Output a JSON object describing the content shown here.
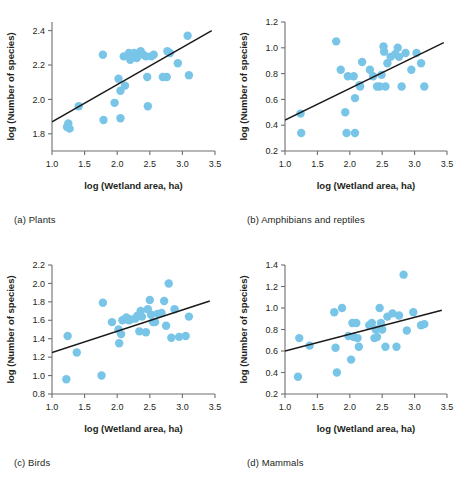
{
  "figure": {
    "marker_color": "#79c5e8",
    "line_color": "#1a1a1a",
    "axis_color": "#6d6e71",
    "text_color": "#231f20"
  },
  "common": {
    "xlabel": "log (Wetland area, ha)",
    "ylabel": "log (Number of species)",
    "xlim": [
      1.0,
      3.5
    ],
    "xticks": [
      1.0,
      1.5,
      2.0,
      2.5,
      3.0,
      3.5
    ],
    "xticklabels": [
      "1.0",
      "1.5",
      "2.0",
      "2.5",
      "3.0",
      "3.5"
    ]
  },
  "chart_data": [
    {
      "id": "panel-a",
      "type": "scatter",
      "caption": "(a) Plants",
      "caption_letter": "(a)",
      "caption_name": "Plants",
      "title": "",
      "xlabel": "log (Wetland area, ha)",
      "ylabel": "log (Number of species)",
      "xlim": [
        1.0,
        3.5
      ],
      "ylim": [
        1.7,
        2.45
      ],
      "xticks": [
        1.0,
        1.5,
        2.0,
        2.5,
        3.0,
        3.5
      ],
      "yticks": [
        1.8,
        2.0,
        2.2,
        2.4
      ],
      "yticklabels": [
        "1.8",
        "2.0",
        "2.2",
        "2.4"
      ],
      "grid": false,
      "legend": "none",
      "trendline": {
        "x0": 1.0,
        "y0": 1.87,
        "x1": 3.45,
        "y1": 2.4
      },
      "points": [
        {
          "x": 1.23,
          "y": 1.84
        },
        {
          "x": 1.27,
          "y": 1.83
        },
        {
          "x": 1.25,
          "y": 1.86
        },
        {
          "x": 1.41,
          "y": 1.96
        },
        {
          "x": 1.78,
          "y": 2.26
        },
        {
          "x": 1.79,
          "y": 1.88
        },
        {
          "x": 1.96,
          "y": 1.98
        },
        {
          "x": 2.02,
          "y": 2.12
        },
        {
          "x": 2.05,
          "y": 2.05
        },
        {
          "x": 2.05,
          "y": 1.89
        },
        {
          "x": 2.1,
          "y": 2.25
        },
        {
          "x": 2.12,
          "y": 2.08
        },
        {
          "x": 2.18,
          "y": 2.27
        },
        {
          "x": 2.2,
          "y": 2.23
        },
        {
          "x": 2.26,
          "y": 2.27
        },
        {
          "x": 2.3,
          "y": 2.24
        },
        {
          "x": 2.36,
          "y": 2.28
        },
        {
          "x": 2.4,
          "y": 2.26
        },
        {
          "x": 2.44,
          "y": 2.25
        },
        {
          "x": 2.46,
          "y": 2.13
        },
        {
          "x": 2.47,
          "y": 1.96
        },
        {
          "x": 2.52,
          "y": 2.25
        },
        {
          "x": 2.56,
          "y": 2.26
        },
        {
          "x": 2.7,
          "y": 2.13
        },
        {
          "x": 2.76,
          "y": 2.13
        },
        {
          "x": 2.77,
          "y": 2.28
        },
        {
          "x": 2.81,
          "y": 2.27
        },
        {
          "x": 2.93,
          "y": 2.21
        },
        {
          "x": 3.08,
          "y": 2.37
        },
        {
          "x": 3.1,
          "y": 2.14
        }
      ]
    },
    {
      "id": "panel-b",
      "type": "scatter",
      "caption": "(b) Amphibians and reptiles",
      "caption_letter": "(b)",
      "caption_name": "Amphibians and reptiles",
      "title": "",
      "xlabel": "log (Wetland area, ha)",
      "ylabel": "log (Number of species)",
      "xlim": [
        1.0,
        3.5
      ],
      "ylim": [
        0.2,
        1.2
      ],
      "xticks": [
        1.0,
        1.5,
        2.0,
        2.5,
        3.0,
        3.5
      ],
      "yticks": [
        0.2,
        0.4,
        0.6,
        0.8,
        1.0,
        1.2
      ],
      "yticklabels": [
        "0.2",
        "0.4",
        "0.6",
        "0.8",
        "1.0",
        "1.2"
      ],
      "grid": false,
      "legend": "none",
      "trendline": {
        "x0": 1.0,
        "y0": 0.44,
        "x1": 3.45,
        "y1": 1.04
      },
      "points": [
        {
          "x": 1.24,
          "y": 0.49
        },
        {
          "x": 1.25,
          "y": 0.34
        },
        {
          "x": 1.79,
          "y": 1.05
        },
        {
          "x": 1.86,
          "y": 0.83
        },
        {
          "x": 1.93,
          "y": 0.5
        },
        {
          "x": 1.95,
          "y": 0.34
        },
        {
          "x": 1.97,
          "y": 0.78
        },
        {
          "x": 2.06,
          "y": 0.78
        },
        {
          "x": 2.08,
          "y": 0.61
        },
        {
          "x": 2.08,
          "y": 0.34
        },
        {
          "x": 2.15,
          "y": 0.71
        },
        {
          "x": 2.16,
          "y": 0.7
        },
        {
          "x": 2.19,
          "y": 0.89
        },
        {
          "x": 2.31,
          "y": 0.83
        },
        {
          "x": 2.36,
          "y": 0.78
        },
        {
          "x": 2.42,
          "y": 0.7
        },
        {
          "x": 2.46,
          "y": 0.7
        },
        {
          "x": 2.49,
          "y": 0.79
        },
        {
          "x": 2.52,
          "y": 1.01
        },
        {
          "x": 2.53,
          "y": 0.97
        },
        {
          "x": 2.55,
          "y": 0.7
        },
        {
          "x": 2.58,
          "y": 0.88
        },
        {
          "x": 2.63,
          "y": 0.93
        },
        {
          "x": 2.7,
          "y": 0.95
        },
        {
          "x": 2.74,
          "y": 1.0
        },
        {
          "x": 2.76,
          "y": 0.93
        },
        {
          "x": 2.8,
          "y": 0.7
        },
        {
          "x": 2.86,
          "y": 0.96
        },
        {
          "x": 2.95,
          "y": 0.83
        },
        {
          "x": 3.03,
          "y": 0.96
        },
        {
          "x": 3.1,
          "y": 0.88
        },
        {
          "x": 3.15,
          "y": 0.7
        }
      ]
    },
    {
      "id": "panel-c",
      "type": "scatter",
      "caption": "(c) Birds",
      "caption_letter": "(c)",
      "caption_name": "Birds",
      "title": "",
      "xlabel": "log (Wetland area, ha)",
      "ylabel": "log (Number of species)",
      "xlim": [
        1.0,
        3.5
      ],
      "ylim": [
        0.8,
        2.2
      ],
      "xticks": [
        1.0,
        1.5,
        2.0,
        2.5,
        3.0,
        3.5
      ],
      "yticks": [
        0.8,
        1.0,
        1.2,
        1.4,
        1.6,
        1.8,
        2.0,
        2.2
      ],
      "yticklabels": [
        "0.8",
        "1.0",
        "1.2",
        "1.4",
        "1.6",
        "1.8",
        "2.0",
        "2.2"
      ],
      "grid": false,
      "legend": "none",
      "trendline": {
        "x0": 1.0,
        "y0": 1.25,
        "x1": 3.42,
        "y1": 1.81
      },
      "points": [
        {
          "x": 1.22,
          "y": 0.96
        },
        {
          "x": 1.24,
          "y": 1.43
        },
        {
          "x": 1.38,
          "y": 1.25
        },
        {
          "x": 1.76,
          "y": 1.0
        },
        {
          "x": 1.78,
          "y": 1.79
        },
        {
          "x": 1.92,
          "y": 1.58
        },
        {
          "x": 2.02,
          "y": 1.5
        },
        {
          "x": 2.03,
          "y": 1.35
        },
        {
          "x": 2.06,
          "y": 1.45
        },
        {
          "x": 2.08,
          "y": 1.6
        },
        {
          "x": 2.14,
          "y": 1.63
        },
        {
          "x": 2.18,
          "y": 1.6
        },
        {
          "x": 2.21,
          "y": 1.61
        },
        {
          "x": 2.28,
          "y": 1.62
        },
        {
          "x": 2.31,
          "y": 1.65
        },
        {
          "x": 2.34,
          "y": 1.48
        },
        {
          "x": 2.36,
          "y": 1.7
        },
        {
          "x": 2.38,
          "y": 1.64
        },
        {
          "x": 2.44,
          "y": 1.47
        },
        {
          "x": 2.47,
          "y": 1.72
        },
        {
          "x": 2.5,
          "y": 1.82
        },
        {
          "x": 2.52,
          "y": 1.66
        },
        {
          "x": 2.55,
          "y": 1.58
        },
        {
          "x": 2.58,
          "y": 1.58
        },
        {
          "x": 2.62,
          "y": 1.67
        },
        {
          "x": 2.68,
          "y": 1.68
        },
        {
          "x": 2.72,
          "y": 1.81
        },
        {
          "x": 2.75,
          "y": 1.54
        },
        {
          "x": 2.79,
          "y": 2.0
        },
        {
          "x": 2.83,
          "y": 1.41
        },
        {
          "x": 2.88,
          "y": 1.72
        },
        {
          "x": 2.95,
          "y": 1.42
        },
        {
          "x": 3.05,
          "y": 1.43
        },
        {
          "x": 3.1,
          "y": 1.64
        }
      ]
    },
    {
      "id": "panel-d",
      "type": "scatter",
      "caption": "(d) Mammals",
      "caption_letter": "(d)",
      "caption_name": "Mammals",
      "title": "",
      "xlabel": "log (Wetland area, ha)",
      "ylabel": "log (Number of species)",
      "xlim": [
        1.0,
        3.5
      ],
      "ylim": [
        0.2,
        1.4
      ],
      "xticks": [
        1.0,
        1.5,
        2.0,
        2.5,
        3.0,
        3.5
      ],
      "yticks": [
        0.2,
        0.4,
        0.6,
        0.8,
        1.0,
        1.2,
        1.4
      ],
      "yticklabels": [
        "0.2",
        "0.4",
        "0.6",
        "0.8",
        "1.0",
        "1.2",
        "1.4"
      ],
      "grid": false,
      "legend": "none",
      "trendline": {
        "x0": 1.0,
        "y0": 0.6,
        "x1": 3.42,
        "y1": 0.98
      },
      "points": [
        {
          "x": 1.2,
          "y": 0.36
        },
        {
          "x": 1.22,
          "y": 0.72
        },
        {
          "x": 1.38,
          "y": 0.65
        },
        {
          "x": 1.76,
          "y": 0.96
        },
        {
          "x": 1.78,
          "y": 0.63
        },
        {
          "x": 1.8,
          "y": 0.4
        },
        {
          "x": 1.88,
          "y": 1.0
        },
        {
          "x": 1.98,
          "y": 0.74
        },
        {
          "x": 2.02,
          "y": 0.52
        },
        {
          "x": 2.04,
          "y": 0.86
        },
        {
          "x": 2.06,
          "y": 0.73
        },
        {
          "x": 2.1,
          "y": 0.86
        },
        {
          "x": 2.12,
          "y": 0.72
        },
        {
          "x": 2.14,
          "y": 0.64
        },
        {
          "x": 2.3,
          "y": 0.84
        },
        {
          "x": 2.34,
          "y": 0.86
        },
        {
          "x": 2.38,
          "y": 0.72
        },
        {
          "x": 2.4,
          "y": 0.8
        },
        {
          "x": 2.42,
          "y": 0.73
        },
        {
          "x": 2.46,
          "y": 1.0
        },
        {
          "x": 2.48,
          "y": 0.86
        },
        {
          "x": 2.5,
          "y": 0.8
        },
        {
          "x": 2.55,
          "y": 0.64
        },
        {
          "x": 2.58,
          "y": 0.92
        },
        {
          "x": 2.66,
          "y": 0.95
        },
        {
          "x": 2.72,
          "y": 0.64
        },
        {
          "x": 2.76,
          "y": 0.93
        },
        {
          "x": 2.83,
          "y": 1.31
        },
        {
          "x": 2.88,
          "y": 0.79
        },
        {
          "x": 2.98,
          "y": 0.96
        },
        {
          "x": 3.1,
          "y": 0.84
        },
        {
          "x": 3.15,
          "y": 0.85
        }
      ]
    }
  ]
}
